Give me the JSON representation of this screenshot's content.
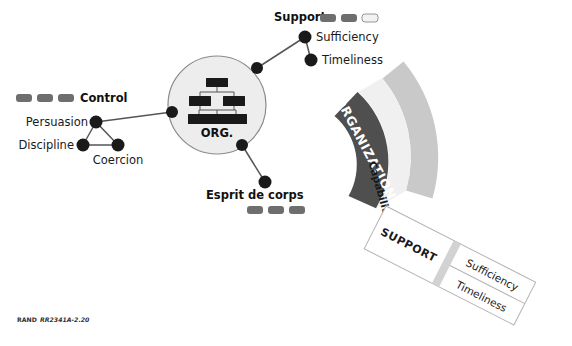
{
  "figure": {
    "caption_prefix": "RAND",
    "caption_id": "RR2341A-2.20"
  },
  "network": {
    "center": {
      "label": "ORG.",
      "name": "organization-circle"
    },
    "groups": [
      {
        "key": "control",
        "label": "Control",
        "chips": [
          "#6e6e6e",
          "#6e6e6e",
          "#6e6e6e"
        ]
      },
      {
        "key": "support",
        "label": "Support",
        "chips": [
          "#6e6e6e",
          "#6e6e6e",
          "#f2f2f2"
        ]
      },
      {
        "key": "esprit",
        "label": "Esprit de corps",
        "chips": [
          "#6e6e6e",
          "#6e6e6e",
          "#6e6e6e"
        ]
      }
    ],
    "nodes": [
      {
        "key": "persuasion",
        "label": "Persuasion"
      },
      {
        "key": "discipline",
        "label": "Discipline"
      },
      {
        "key": "coercion",
        "label": "Coercion"
      },
      {
        "key": "sufficiency",
        "label": "Sufficiency"
      },
      {
        "key": "timeliness",
        "label": "Timeliness"
      }
    ]
  },
  "arcs": {
    "organization": {
      "label": "ORGANIZATION",
      "color": "#4f4f4f"
    },
    "capabilities": {
      "label": "Capabilities",
      "color": "#f0f0f0"
    },
    "outer": {
      "label": "",
      "color": "#c9c9c9"
    }
  },
  "banner": {
    "title": "SUPPORT",
    "rows": [
      {
        "key": "sufficiency",
        "label": "Sufficiency"
      },
      {
        "key": "timeliness",
        "label": "Timeliness"
      }
    ]
  },
  "colors": {
    "node_fill": "#1a1a1a",
    "circle_fill": "#ededed",
    "circle_stroke": "#8a8a8a",
    "link_stroke": "#555555",
    "chip_dark": "#6e6e6e",
    "chip_light": "#f2f2f2",
    "band_dark": "#4f4f4f",
    "band_mid": "#c9c9c9",
    "band_light": "#f0f0f0",
    "banner_fill": "#ffffff",
    "banner_stroke": "#b5b5b5",
    "banner_divider": "#c9c9c9"
  }
}
